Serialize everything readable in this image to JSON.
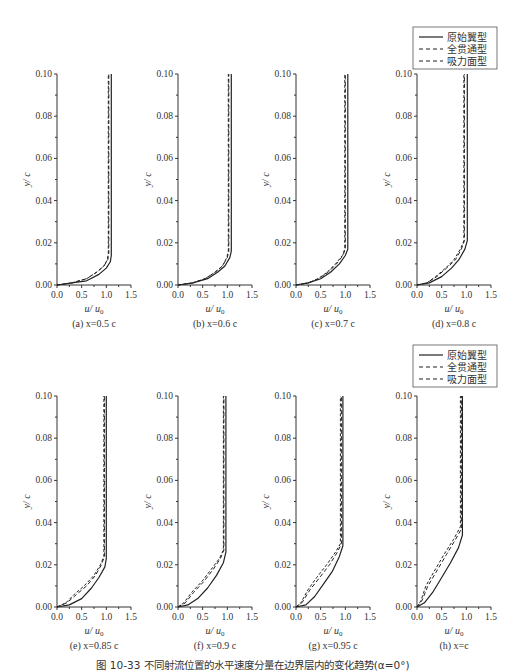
{
  "figure": {
    "caption": "图 10-33  不同射流位置的水平速度分量在边界层内的变化趋势(α=0°)",
    "legend": [
      {
        "label": "原始翼型",
        "style": "solid"
      },
      {
        "label": "全贯通型",
        "style": "dashed"
      },
      {
        "label": "吸力面型",
        "style": "dashed"
      }
    ]
  },
  "chart_data": [
    {
      "type": "line",
      "id": "a",
      "title": "(a) x=0.5 c",
      "xlabel": "u/u0",
      "ylabel": "y/c",
      "xlim": [
        0,
        1.5
      ],
      "ylim": [
        0,
        0.1
      ],
      "xticks": [
        "0.0",
        "0.5",
        "1.0",
        "1.5"
      ],
      "yticks": [
        "0.00",
        "0.02",
        "0.04",
        "0.06",
        "0.08",
        "0.10"
      ],
      "series": [
        {
          "name": "原始翼型",
          "x": [
            0,
            0.3,
            0.6,
            0.85,
            1.0,
            1.08,
            1.1,
            1.1
          ],
          "y": [
            0,
            0.001,
            0.002,
            0.005,
            0.008,
            0.011,
            0.014,
            0.1
          ]
        },
        {
          "name": "全贯通型",
          "x": [
            0,
            0.3,
            0.6,
            0.8,
            0.95,
            1.03,
            1.05,
            1.05
          ],
          "y": [
            0,
            0.001,
            0.003,
            0.006,
            0.009,
            0.012,
            0.015,
            0.1
          ]
        },
        {
          "name": "吸力面型",
          "x": [
            0,
            0.3,
            0.6,
            0.8,
            0.95,
            1.02,
            1.04,
            1.04
          ],
          "y": [
            0,
            0.001,
            0.003,
            0.006,
            0.009,
            0.012,
            0.015,
            0.1
          ]
        }
      ]
    },
    {
      "type": "line",
      "id": "b",
      "title": "(b) x=0.6 c",
      "xlabel": "u/u0",
      "ylabel": "y/c",
      "xlim": [
        0,
        1.5
      ],
      "ylim": [
        0,
        0.1
      ],
      "xticks": [
        "0.0",
        "0.5",
        "1.0",
        "1.5"
      ],
      "yticks": [
        "0.00",
        "0.02",
        "0.04",
        "0.06",
        "0.08",
        "0.10"
      ],
      "series": [
        {
          "name": "原始翼型",
          "x": [
            0,
            0.3,
            0.6,
            0.8,
            0.95,
            1.05,
            1.08,
            1.08
          ],
          "y": [
            0,
            0.001,
            0.003,
            0.006,
            0.009,
            0.013,
            0.016,
            0.1
          ]
        },
        {
          "name": "全贯通型",
          "x": [
            0,
            0.3,
            0.55,
            0.75,
            0.9,
            1.0,
            1.03,
            1.03
          ],
          "y": [
            0,
            0.001,
            0.003,
            0.006,
            0.009,
            0.013,
            0.016,
            0.1
          ]
        },
        {
          "name": "吸力面型",
          "x": [
            0,
            0.3,
            0.55,
            0.75,
            0.9,
            0.99,
            1.02,
            1.02
          ],
          "y": [
            0,
            0.001,
            0.003,
            0.006,
            0.009,
            0.013,
            0.016,
            0.1
          ]
        }
      ]
    },
    {
      "type": "line",
      "id": "c",
      "title": "(c) x=0.7 c",
      "xlabel": "u/u0",
      "ylabel": "y/c",
      "xlim": [
        0,
        1.5
      ],
      "ylim": [
        0,
        0.1
      ],
      "xticks": [
        "0.0",
        "0.5",
        "1.0",
        "1.5"
      ],
      "yticks": [
        "0.00",
        "0.02",
        "0.04",
        "0.06",
        "0.08",
        "0.10"
      ],
      "series": [
        {
          "name": "原始翼型",
          "x": [
            0,
            0.25,
            0.5,
            0.7,
            0.88,
            1.0,
            1.05,
            1.05
          ],
          "y": [
            0,
            0.001,
            0.003,
            0.006,
            0.01,
            0.014,
            0.017,
            0.1
          ]
        },
        {
          "name": "全贯通型",
          "x": [
            0,
            0.25,
            0.45,
            0.65,
            0.82,
            0.95,
            1.0,
            1.0
          ],
          "y": [
            0,
            0.001,
            0.003,
            0.006,
            0.01,
            0.014,
            0.017,
            0.1
          ]
        },
        {
          "name": "吸力面型",
          "x": [
            0,
            0.25,
            0.45,
            0.63,
            0.8,
            0.94,
            0.99,
            0.99
          ],
          "y": [
            0,
            0.001,
            0.003,
            0.006,
            0.01,
            0.014,
            0.017,
            0.1
          ]
        }
      ]
    },
    {
      "type": "line",
      "id": "d",
      "title": "(d) x=0.8 c",
      "xlabel": "u/u0",
      "ylabel": "y/c",
      "xlim": [
        0,
        1.5
      ],
      "ylim": [
        0,
        0.1
      ],
      "xticks": [
        "0.0",
        "0.5",
        "1.0",
        "1.5"
      ],
      "yticks": [
        "0.00",
        "0.02",
        "0.04",
        "0.06",
        "0.08",
        "0.10"
      ],
      "series": [
        {
          "name": "原始翼型",
          "x": [
            0,
            0.25,
            0.5,
            0.7,
            0.85,
            0.97,
            1.02,
            1.02
          ],
          "y": [
            0,
            0.001,
            0.004,
            0.008,
            0.012,
            0.017,
            0.021,
            0.1
          ]
        },
        {
          "name": "全贯通型",
          "x": [
            0,
            0.2,
            0.4,
            0.6,
            0.78,
            0.9,
            0.96,
            0.96
          ],
          "y": [
            0,
            0.001,
            0.004,
            0.008,
            0.012,
            0.017,
            0.021,
            0.1
          ]
        },
        {
          "name": "吸力面型",
          "x": [
            0,
            0.2,
            0.38,
            0.58,
            0.75,
            0.88,
            0.95,
            0.95
          ],
          "y": [
            0,
            0.001,
            0.004,
            0.008,
            0.012,
            0.017,
            0.021,
            0.1
          ]
        }
      ]
    },
    {
      "type": "line",
      "id": "e",
      "title": "(e) x=0.85 c",
      "xlabel": "u/u0",
      "ylabel": "y/c",
      "xlim": [
        0,
        1.5
      ],
      "ylim": [
        0,
        0.1
      ],
      "xticks": [
        "0.0",
        "0.5",
        "1.0",
        "1.5"
      ],
      "yticks": [
        "0.00",
        "0.02",
        "0.04",
        "0.06",
        "0.08",
        "0.10"
      ],
      "series": [
        {
          "name": "原始翼型",
          "x": [
            0,
            0.25,
            0.5,
            0.7,
            0.85,
            0.97,
            1.0,
            1.0
          ],
          "y": [
            0,
            0.001,
            0.004,
            0.009,
            0.014,
            0.019,
            0.023,
            0.1
          ]
        },
        {
          "name": "全贯通型",
          "x": [
            0,
            0.2,
            0.4,
            0.6,
            0.78,
            0.9,
            0.96,
            0.96
          ],
          "y": [
            0,
            0.002,
            0.006,
            0.01,
            0.015,
            0.02,
            0.024,
            0.1
          ]
        },
        {
          "name": "吸力面型",
          "x": [
            0,
            0.18,
            0.35,
            0.55,
            0.75,
            0.88,
            0.95,
            0.95
          ],
          "y": [
            0,
            0.002,
            0.006,
            0.01,
            0.015,
            0.02,
            0.024,
            0.1
          ]
        }
      ]
    },
    {
      "type": "line",
      "id": "f",
      "title": "(f) x=0.9 c",
      "xlabel": "u/u0",
      "ylabel": "y/c",
      "xlim": [
        0,
        1.5
      ],
      "ylim": [
        0,
        0.1
      ],
      "xticks": [
        "0.0",
        "0.5",
        "1.0",
        "1.5"
      ],
      "yticks": [
        "0.00",
        "0.02",
        "0.04",
        "0.06",
        "0.08",
        "0.10"
      ],
      "series": [
        {
          "name": "原始翼型",
          "x": [
            0,
            0.2,
            0.4,
            0.6,
            0.78,
            0.92,
            0.97,
            0.97
          ],
          "y": [
            0,
            0.001,
            0.004,
            0.009,
            0.015,
            0.021,
            0.026,
            0.1
          ]
        },
        {
          "name": "全贯通型",
          "x": [
            0,
            0.15,
            0.32,
            0.52,
            0.72,
            0.86,
            0.93,
            0.93
          ],
          "y": [
            0,
            0.002,
            0.007,
            0.012,
            0.018,
            0.023,
            0.027,
            0.1
          ]
        },
        {
          "name": "吸力面型",
          "x": [
            0,
            0.12,
            0.28,
            0.48,
            0.68,
            0.84,
            0.92,
            0.92
          ],
          "y": [
            0,
            0.002,
            0.007,
            0.012,
            0.018,
            0.023,
            0.027,
            0.1
          ]
        }
      ]
    },
    {
      "type": "line",
      "id": "g",
      "title": "(g) x=0.95 c",
      "xlabel": "u/u0",
      "ylabel": "y/c",
      "xlim": [
        0,
        1.5
      ],
      "ylim": [
        0,
        0.1
      ],
      "xticks": [
        "0.0",
        "0.5",
        "1.0",
        "1.5"
      ],
      "yticks": [
        "0.00",
        "0.02",
        "0.04",
        "0.06",
        "0.08",
        "0.10"
      ],
      "series": [
        {
          "name": "原始翼型",
          "x": [
            0,
            0.2,
            0.38,
            0.56,
            0.74,
            0.88,
            0.95,
            0.95
          ],
          "y": [
            0,
            0.001,
            0.005,
            0.011,
            0.017,
            0.024,
            0.029,
            0.1
          ]
        },
        {
          "name": "全贯通型",
          "x": [
            0,
            0.12,
            0.28,
            0.48,
            0.68,
            0.84,
            0.92,
            0.92
          ],
          "y": [
            0,
            0.002,
            0.008,
            0.014,
            0.02,
            0.026,
            0.03,
            0.1
          ]
        },
        {
          "name": "吸力面型",
          "x": [
            0,
            0.1,
            0.24,
            0.42,
            0.62,
            0.8,
            0.9,
            0.9
          ],
          "y": [
            0,
            0.002,
            0.008,
            0.014,
            0.02,
            0.026,
            0.03,
            0.1
          ]
        }
      ]
    },
    {
      "type": "line",
      "id": "h",
      "title": "(h) x=c",
      "xlabel": "u/u0",
      "ylabel": "y/c",
      "xlim": [
        0,
        1.5
      ],
      "ylim": [
        0,
        0.1
      ],
      "xticks": [
        "0.0",
        "0.5",
        "1.0",
        "1.5"
      ],
      "yticks": [
        "0.00",
        "0.02",
        "0.04",
        "0.06",
        "0.08",
        "0.10"
      ],
      "series": [
        {
          "name": "原始翼型",
          "x": [
            0,
            0.15,
            0.32,
            0.5,
            0.68,
            0.84,
            0.92,
            0.92
          ],
          "y": [
            0,
            0.002,
            0.007,
            0.014,
            0.021,
            0.028,
            0.034,
            0.1
          ]
        },
        {
          "name": "全贯通型",
          "x": [
            0,
            0.1,
            0.22,
            0.4,
            0.6,
            0.78,
            0.9,
            0.9
          ],
          "y": [
            0,
            0.003,
            0.01,
            0.017,
            0.025,
            0.032,
            0.037,
            0.1
          ]
        },
        {
          "name": "吸力面型",
          "x": [
            0,
            0.08,
            0.18,
            0.35,
            0.55,
            0.74,
            0.88,
            0.88
          ],
          "y": [
            0,
            0.003,
            0.01,
            0.017,
            0.025,
            0.032,
            0.038,
            0.1
          ]
        }
      ]
    }
  ]
}
